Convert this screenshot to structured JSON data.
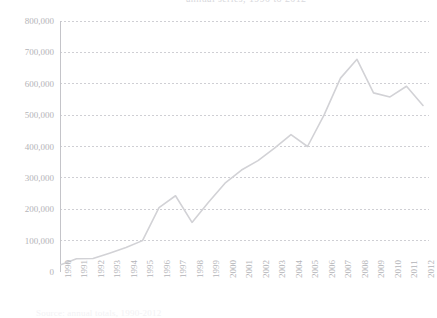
{
  "figure": {
    "top_clipped_text": "annual series, 1990 to 2012",
    "bottom_clipped_text": "Source: annual totals, 1990-2012"
  },
  "axis": {
    "y_tick_labels": [
      "800,000",
      "700,000",
      "600,000",
      "500,000",
      "400,000",
      "300,000",
      "200,000",
      "100,000",
      "0"
    ],
    "x_tick_labels": [
      "1990",
      "1991",
      "1992",
      "1993",
      "1994",
      "1995",
      "1996",
      "1997",
      "1998",
      "1999",
      "2000",
      "2001",
      "2002",
      "2003",
      "2004",
      "2005",
      "2006",
      "2007",
      "2008",
      "2009",
      "2010",
      "2011",
      "2012"
    ]
  },
  "style": {
    "line_color": "#d2d2d6",
    "grid_color": "#cfcfd4",
    "axis_color": "#c4c4c9",
    "text_color": "#b4b4b8",
    "background": "#ffffff"
  },
  "chart_data": {
    "type": "line",
    "title": "",
    "subtitle": "",
    "xlabel": "",
    "ylabel": "",
    "grid": true,
    "legend": false,
    "legend_position": "none",
    "xlim": [
      1990,
      2012
    ],
    "ylim": [
      0,
      800000
    ],
    "ytick_values": [
      0,
      100000,
      200000,
      300000,
      400000,
      500000,
      600000,
      700000,
      800000
    ],
    "categories": [
      1990,
      1991,
      1992,
      1993,
      1994,
      1995,
      1996,
      1997,
      1998,
      1999,
      2000,
      2001,
      2002,
      2003,
      2004,
      2005,
      2006,
      2007,
      2008,
      2009,
      2010,
      2011,
      2012
    ],
    "x": [
      1990,
      1991,
      1992,
      1993,
      1994,
      1995,
      1996,
      1997,
      1998,
      1999,
      2000,
      2001,
      2002,
      2003,
      2004,
      2005,
      2006,
      2007,
      2008,
      2009,
      2010,
      2011,
      2012
    ],
    "values": [
      22000,
      42000,
      43000,
      60000,
      78000,
      100000,
      205000,
      243000,
      158000,
      222000,
      283000,
      325000,
      355000,
      395000,
      438000,
      400000,
      500000,
      618000,
      678000,
      571000,
      558000,
      592000,
      531000
    ],
    "series": [
      {
        "name": "series-1",
        "color": "#d2d2d6",
        "values": [
          22000,
          42000,
          43000,
          60000,
          78000,
          100000,
          205000,
          243000,
          158000,
          222000,
          283000,
          325000,
          355000,
          395000,
          438000,
          400000,
          500000,
          618000,
          678000,
          571000,
          558000,
          592000,
          531000
        ]
      }
    ]
  }
}
